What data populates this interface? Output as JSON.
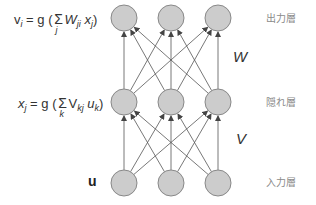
{
  "diagram": {
    "title": "",
    "colors": {
      "node_fill": "#cccccc",
      "node_stroke": "#888888",
      "edge": "#555555",
      "text": "#333333",
      "layer_label": "#8a8a8a"
    },
    "node_radius": 13,
    "layers": [
      {
        "id": "output",
        "label": "出力層",
        "y": 18,
        "x": [
          124,
          171,
          218
        ]
      },
      {
        "id": "hidden",
        "label": "隠れ層",
        "y": 102,
        "x": [
          124,
          171,
          218
        ]
      },
      {
        "id": "input",
        "label": "入力層",
        "y": 183,
        "x": [
          124,
          171,
          218
        ]
      }
    ],
    "weights": [
      {
        "label": "W",
        "between": [
          "hidden",
          "output"
        ]
      },
      {
        "label": "V",
        "between": [
          "input",
          "hidden"
        ]
      }
    ],
    "equations": {
      "output": {
        "lhs": "v",
        "lhs_sub": "i",
        "eq": " = g (",
        "sum_idx": "j",
        "w": "W",
        "w_sub": "ji",
        "x": "x",
        "x_sub": "j",
        "close": ")"
      },
      "hidden": {
        "lhs": "x",
        "lhs_sub": "j",
        "eq": " = g (",
        "sum_idx": "k",
        "w": "V",
        "w_sub": "kj",
        "x": "u",
        "x_sub": "k",
        "close": ")"
      }
    },
    "input_vector_label": "u"
  }
}
